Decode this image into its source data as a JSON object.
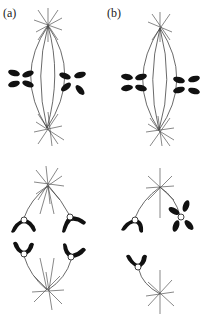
{
  "figure": {
    "panels": [
      {
        "id": "a",
        "label": "(a)",
        "stage_top": "metaphase (chromosomes paired along spindle)",
        "stage_bottom": "anaphase (normal segregation)"
      },
      {
        "id": "b",
        "label": "(b)",
        "stage_top": "metaphase (chromosomes paired along spindle)",
        "stage_bottom": "anaphase (nondisjunction)"
      }
    ],
    "colors": {
      "chromosome": "#111111",
      "spindle_fiber": "#444444",
      "background": "#ffffff"
    },
    "icons": [
      "spindle-pole-aster",
      "chromosome",
      "kinetochore"
    ]
  }
}
